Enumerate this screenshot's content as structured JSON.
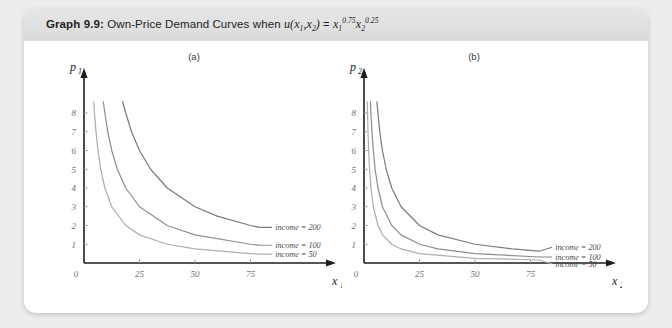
{
  "figure": {
    "number_label": "Graph 9.9:",
    "title_text": "Own-Price Demand Curves when",
    "utility_u": "u",
    "utility_args": "(x",
    "util_sub1": "1",
    "util_comma": ",x",
    "util_sub2": "2",
    "util_close": ")",
    "equals": "=",
    "rhs_x1": "x",
    "rhs_x1_sub": "1",
    "rhs_x1_sup": "0.75",
    "rhs_x2": "x",
    "rhs_x2_sub": "2",
    "rhs_x2_sup": "0.25"
  },
  "panels": [
    {
      "label": "(a)",
      "x_axis_name": "x",
      "x_axis_sub": "1",
      "y_axis_name": "p",
      "y_axis_sub": "1",
      "origin_label": "0",
      "x_ticks": [
        "25",
        "50",
        "75"
      ],
      "y_ticks": [
        "1",
        "2",
        "3",
        "4",
        "5",
        "6",
        "7",
        "8"
      ],
      "legend": [
        "income = 200",
        "income = 100",
        "income = 50"
      ]
    },
    {
      "label": "(b)",
      "x_axis_name": "x",
      "x_axis_sub": "2",
      "y_axis_name": "p",
      "y_axis_sub": "2",
      "origin_label": "0",
      "x_ticks": [
        "25",
        "50",
        "75"
      ],
      "y_ticks": [
        "1",
        "2",
        "3",
        "4",
        "5",
        "6",
        "7",
        "8"
      ],
      "legend": [
        "income = 200",
        "income = 100",
        "income = 50"
      ]
    }
  ],
  "colors": {
    "curve_200": "#7c7c7c",
    "curve_100": "#8f8f8f",
    "curve_50": "#aeaeae",
    "axis": "#1d1d1d",
    "tick_text": "#6e6e6e",
    "header_band": "#e2e2e2",
    "page_background": "#ededeb"
  },
  "chart_data": [
    {
      "type": "line",
      "title": "(a) Own-price demand for good 1",
      "xlabel": "x1",
      "ylabel": "p1",
      "xlim": [
        0,
        100
      ],
      "ylim": [
        0,
        8.8
      ],
      "xticks": [
        0,
        25,
        50,
        75
      ],
      "yticks": [
        1,
        2,
        3,
        4,
        5,
        6,
        7,
        8
      ],
      "grid": false,
      "legend_position": "right-inline",
      "formula": "x1 = 0.75 * income / p1",
      "series": [
        {
          "name": "income = 200",
          "income": 200,
          "color": "#7c7c7c",
          "points": [
            {
              "p": 8.6,
              "x": 17.4
            },
            {
              "p": 8.0,
              "x": 18.8
            },
            {
              "p": 7.0,
              "x": 21.4
            },
            {
              "p": 6.0,
              "x": 25.0
            },
            {
              "p": 5.0,
              "x": 30.0
            },
            {
              "p": 4.0,
              "x": 37.5
            },
            {
              "p": 3.0,
              "x": 50.0
            },
            {
              "p": 2.5,
              "x": 60.0
            },
            {
              "p": 2.0,
              "x": 75.0
            },
            {
              "p": 1.9,
              "x": 78.9
            }
          ]
        },
        {
          "name": "income = 100",
          "income": 100,
          "color": "#8f8f8f",
          "points": [
            {
              "p": 8.6,
              "x": 8.7
            },
            {
              "p": 8.0,
              "x": 9.4
            },
            {
              "p": 7.0,
              "x": 10.7
            },
            {
              "p": 6.0,
              "x": 12.5
            },
            {
              "p": 5.0,
              "x": 15.0
            },
            {
              "p": 4.0,
              "x": 18.8
            },
            {
              "p": 3.0,
              "x": 25.0
            },
            {
              "p": 2.0,
              "x": 37.5
            },
            {
              "p": 1.5,
              "x": 50.0
            },
            {
              "p": 1.0,
              "x": 75.0
            },
            {
              "p": 0.95,
              "x": 78.9
            }
          ]
        },
        {
          "name": "income = 50",
          "income": 50,
          "color": "#aeaeae",
          "points": [
            {
              "p": 8.6,
              "x": 4.4
            },
            {
              "p": 8.0,
              "x": 4.7
            },
            {
              "p": 7.0,
              "x": 5.4
            },
            {
              "p": 6.0,
              "x": 6.3
            },
            {
              "p": 5.0,
              "x": 7.5
            },
            {
              "p": 4.0,
              "x": 9.4
            },
            {
              "p": 3.0,
              "x": 12.5
            },
            {
              "p": 2.0,
              "x": 18.8
            },
            {
              "p": 1.5,
              "x": 25.0
            },
            {
              "p": 1.0,
              "x": 37.5
            },
            {
              "p": 0.75,
              "x": 50.0
            },
            {
              "p": 0.5,
              "x": 75.0
            },
            {
              "p": 0.475,
              "x": 78.9
            }
          ]
        }
      ]
    },
    {
      "type": "line",
      "title": "(b) Own-price demand for good 2",
      "xlabel": "x2",
      "ylabel": "p2",
      "xlim": [
        0,
        100
      ],
      "ylim": [
        0,
        8.8
      ],
      "xticks": [
        0,
        25,
        50,
        75
      ],
      "yticks": [
        1,
        2,
        3,
        4,
        5,
        6,
        7,
        8
      ],
      "grid": false,
      "legend_position": "right-inline",
      "formula": "x2 = 0.25 * income / p2",
      "series": [
        {
          "name": "income = 200",
          "income": 200,
          "color": "#7c7c7c",
          "points": [
            {
              "p": 8.6,
              "x": 5.8
            },
            {
              "p": 8.0,
              "x": 6.3
            },
            {
              "p": 7.0,
              "x": 7.1
            },
            {
              "p": 6.0,
              "x": 8.3
            },
            {
              "p": 5.0,
              "x": 10.0
            },
            {
              "p": 4.0,
              "x": 12.5
            },
            {
              "p": 3.0,
              "x": 16.7
            },
            {
              "p": 2.0,
              "x": 25.0
            },
            {
              "p": 1.5,
              "x": 33.3
            },
            {
              "p": 1.0,
              "x": 50.0
            },
            {
              "p": 0.75,
              "x": 66.7
            },
            {
              "p": 0.63,
              "x": 78.9
            }
          ]
        },
        {
          "name": "income = 100",
          "income": 100,
          "color": "#8f8f8f",
          "points": [
            {
              "p": 8.6,
              "x": 2.9
            },
            {
              "p": 8.0,
              "x": 3.1
            },
            {
              "p": 7.0,
              "x": 3.6
            },
            {
              "p": 6.0,
              "x": 4.2
            },
            {
              "p": 5.0,
              "x": 5.0
            },
            {
              "p": 4.0,
              "x": 6.3
            },
            {
              "p": 3.0,
              "x": 8.3
            },
            {
              "p": 2.0,
              "x": 12.5
            },
            {
              "p": 1.5,
              "x": 16.7
            },
            {
              "p": 1.0,
              "x": 25.0
            },
            {
              "p": 0.75,
              "x": 33.3
            },
            {
              "p": 0.5,
              "x": 50.0
            },
            {
              "p": 0.32,
              "x": 78.9
            }
          ]
        },
        {
          "name": "income = 50",
          "income": 50,
          "color": "#aeaeae",
          "points": [
            {
              "p": 8.6,
              "x": 1.5
            },
            {
              "p": 8.0,
              "x": 1.6
            },
            {
              "p": 7.0,
              "x": 1.8
            },
            {
              "p": 6.0,
              "x": 2.1
            },
            {
              "p": 5.0,
              "x": 2.5
            },
            {
              "p": 4.0,
              "x": 3.1
            },
            {
              "p": 3.0,
              "x": 4.2
            },
            {
              "p": 2.0,
              "x": 6.3
            },
            {
              "p": 1.5,
              "x": 8.3
            },
            {
              "p": 1.0,
              "x": 12.5
            },
            {
              "p": 0.75,
              "x": 16.7
            },
            {
              "p": 0.5,
              "x": 25.0
            },
            {
              "p": 0.25,
              "x": 50.0
            },
            {
              "p": 0.16,
              "x": 78.9
            }
          ]
        }
      ]
    }
  ]
}
